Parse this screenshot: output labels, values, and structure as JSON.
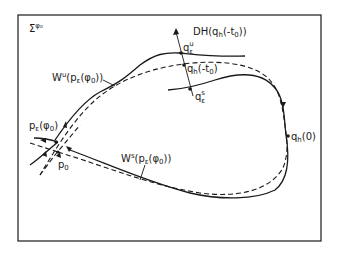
{
  "figure": {
    "frame_label": {
      "main": "Σ",
      "sup": "φ₀"
    },
    "labels": {
      "DH": {
        "main": "DH(q",
        "sub": "h",
        "rest": "(-t",
        "sub2": "0",
        "end": "))"
      },
      "q_eps_u": {
        "main": "q",
        "sub": "ε",
        "sup": "u"
      },
      "q_h_minus_t0": {
        "main": "q",
        "sub": "h",
        "rest": "(-t",
        "sub2": "0",
        "end": ")"
      },
      "q_eps_s": {
        "main": "q",
        "sub": "ε",
        "sup": "s"
      },
      "Wu": {
        "main": "W",
        "sup": "u",
        "rest": "(p",
        "sub": "ε",
        "rest2": "(φ",
        "sub2": "0",
        "end": "))"
      },
      "Ws": {
        "main": "W",
        "sup": "s",
        "rest": "(p",
        "sub": "ε",
        "rest2": "(φ",
        "sub2": "0",
        "end": "))"
      },
      "p_eps_phi0": {
        "main": "p",
        "sub": "ε",
        "rest": "(φ",
        "sub2": "0",
        "end": ")"
      },
      "p0": {
        "main": "p",
        "sub": "0"
      },
      "q_h_0": {
        "main": "q",
        "sub": "h",
        "rest": "(0)"
      }
    },
    "colors": {
      "ink": "#1a1a1a",
      "background": "#ffffff"
    }
  }
}
